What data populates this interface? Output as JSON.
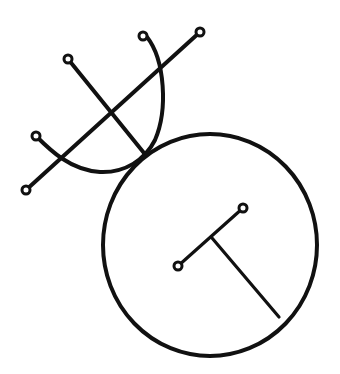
{
  "diagram": {
    "type": "line-drawing",
    "stroke_color": "#111111",
    "background": "#ffffff",
    "shapes": [
      {
        "name": "large-circle",
        "cx": 210,
        "cy": 245,
        "rx": 107,
        "ry": 111
      },
      {
        "name": "half-circle-arc",
        "from": [
          36,
          136
        ],
        "to": [
          147,
          37
        ]
      },
      {
        "name": "long-diagonal-line",
        "from": [
          26,
          190
        ],
        "to": [
          200,
          32
        ]
      },
      {
        "name": "short-diagonal-line",
        "from": [
          68,
          59
        ],
        "to": [
          144,
          153
        ]
      },
      {
        "name": "inner-segment",
        "from": [
          178,
          266
        ],
        "to": [
          243,
          208
        ]
      },
      {
        "name": "inner-stem",
        "from": [
          212,
          238
        ],
        "to": [
          279,
          317
        ]
      }
    ],
    "nodes": [
      [
        26,
        190
      ],
      [
        200,
        32
      ],
      [
        68,
        59
      ],
      [
        36,
        136
      ],
      [
        147,
        37
      ],
      [
        178,
        266
      ],
      [
        243,
        208
      ]
    ]
  }
}
